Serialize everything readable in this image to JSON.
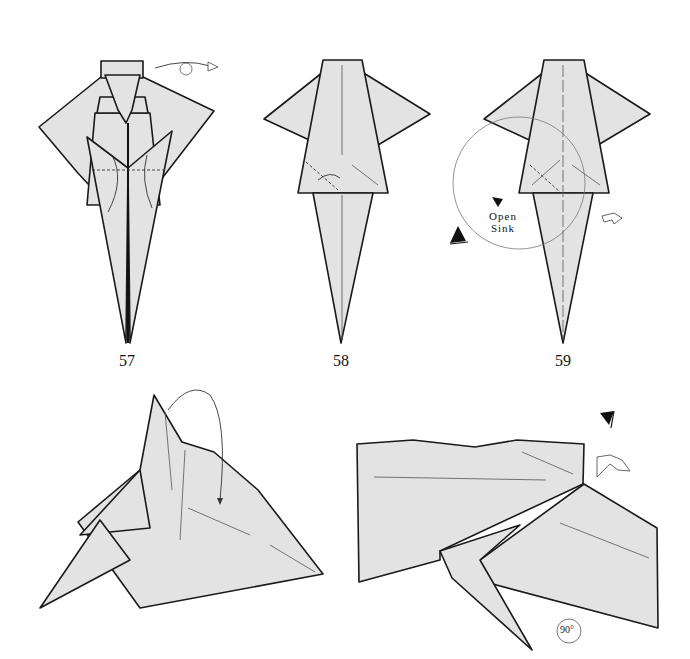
{
  "steps": [
    {
      "number": "57",
      "instruction_symbols": [
        "turn-over-arrow",
        "valley-fold-line",
        "fold-down-arrows"
      ]
    },
    {
      "number": "58",
      "instruction_symbols": [
        "pleat-arrow",
        "crease-lines"
      ]
    },
    {
      "number": "59",
      "instruction_symbols": [
        "view-circle",
        "eye-icon",
        "push-arrow",
        "repeat-arrow"
      ],
      "label_line1": "Open",
      "label_line2": "Sink"
    },
    {
      "number": "",
      "instruction_symbols": [
        "fold-behind-arrow"
      ]
    },
    {
      "number": "",
      "instruction_symbols": [
        "eye-icon",
        "repeat-arrow",
        "rotate-badge"
      ],
      "rotate_label": "90°"
    }
  ],
  "colors": {
    "paper": "#e3e3e3",
    "outline": "#1a1a1a",
    "background": "#ffffff"
  }
}
